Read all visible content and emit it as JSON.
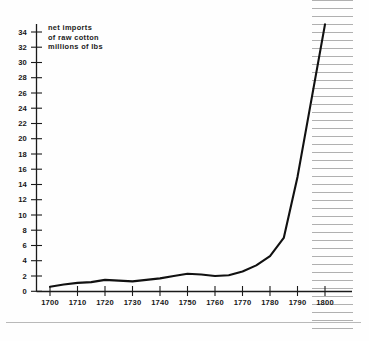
{
  "figure": {
    "title_lines": [
      "net imports",
      "of raw cotton",
      "millions of lbs"
    ]
  },
  "chart_data": {
    "type": "line",
    "xlabel": "",
    "ylabel": "millions of lbs",
    "xlim": [
      1700,
      1800
    ],
    "ylim": [
      0,
      34
    ],
    "grid": false,
    "legend_position": "none",
    "xticks": [
      1700,
      1710,
      1720,
      1730,
      1740,
      1750,
      1760,
      1770,
      1780,
      1790,
      1800
    ],
    "yticks": [
      0,
      2,
      4,
      6,
      8,
      10,
      12,
      14,
      16,
      18,
      20,
      22,
      24,
      26,
      28,
      30,
      32,
      34
    ],
    "annotations": [
      {
        "kind": "shaded-band",
        "style": "horizontal-hatch",
        "x_start": 1795,
        "x_end": 1810,
        "note": "hatched band at right edge of plot"
      }
    ],
    "series": [
      {
        "name": "net imports of raw cotton",
        "color": "#111111",
        "x": [
          1700,
          1705,
          1710,
          1715,
          1720,
          1725,
          1730,
          1735,
          1740,
          1745,
          1750,
          1755,
          1760,
          1765,
          1770,
          1775,
          1780,
          1785,
          1790,
          1795,
          1800
        ],
        "values": [
          0.6,
          0.9,
          1.1,
          1.2,
          1.5,
          1.4,
          1.3,
          1.5,
          1.7,
          2.0,
          2.3,
          2.2,
          2.0,
          2.1,
          2.6,
          3.4,
          4.6,
          7.0,
          15.0,
          25.0,
          35.0
        ]
      }
    ]
  },
  "axis_labels": {
    "y": [
      "34",
      "32",
      "30",
      "28",
      "26",
      "24",
      "22",
      "20",
      "18",
      "16",
      "14",
      "12",
      "10",
      "8",
      "6",
      "4",
      "2",
      "0"
    ],
    "x": [
      "1700",
      "1710",
      "1720",
      "1730",
      "1740",
      "1750",
      "1760",
      "1770",
      "1780",
      "1790",
      "1800"
    ]
  },
  "colors": {
    "line": "#111111",
    "axis": "#1a1a1a",
    "hatch": "#b0b0b0",
    "background": "#fefefe"
  }
}
